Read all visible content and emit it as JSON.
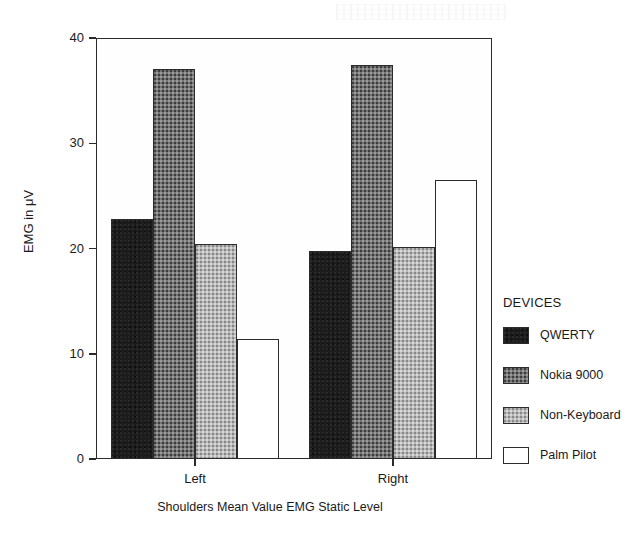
{
  "chart_data": {
    "type": "bar",
    "title": "",
    "caption": "Shoulders Mean Value EMG Static Level",
    "xlabel": "",
    "ylabel": "EMG in μV",
    "ylim": [
      0,
      40
    ],
    "yticks": [
      0,
      10,
      20,
      30,
      40
    ],
    "ytick_labels": [
      "0",
      "10",
      "20",
      "30",
      "40"
    ],
    "grid": false,
    "categories": [
      "Left",
      "Right"
    ],
    "legend_position": "right",
    "legend_title": "DEVICES",
    "series": [
      {
        "name": "QWERTY",
        "values": [
          22.8,
          19.8
        ],
        "color": "#1c1c1c",
        "fill": "solid-dark"
      },
      {
        "name": "Nokia 9000",
        "values": [
          37.1,
          37.4
        ],
        "color": "#757575",
        "fill": "medium-stipple"
      },
      {
        "name": "Non-Keyboard",
        "values": [
          20.4,
          20.1
        ],
        "color": "#b9b9b9",
        "fill": "light-stipple"
      },
      {
        "name": "Palm Pilot",
        "values": [
          11.4,
          26.5
        ],
        "color": "#ffffff",
        "fill": "empty"
      }
    ]
  },
  "axes": {
    "y_title": "EMG in μV",
    "tick_0": "0",
    "tick_10": "10",
    "tick_20": "20",
    "tick_30": "30",
    "tick_40": "40",
    "x_left": "Left",
    "x_right": "Right"
  },
  "legend": {
    "title": "DEVICES",
    "items": [
      {
        "label": "QWERTY"
      },
      {
        "label": "Nokia 9000"
      },
      {
        "label": "Non-Keyboard"
      },
      {
        "label": "Palm Pilot"
      }
    ]
  },
  "caption": {
    "text": "Shoulders Mean Value EMG Static Level"
  }
}
